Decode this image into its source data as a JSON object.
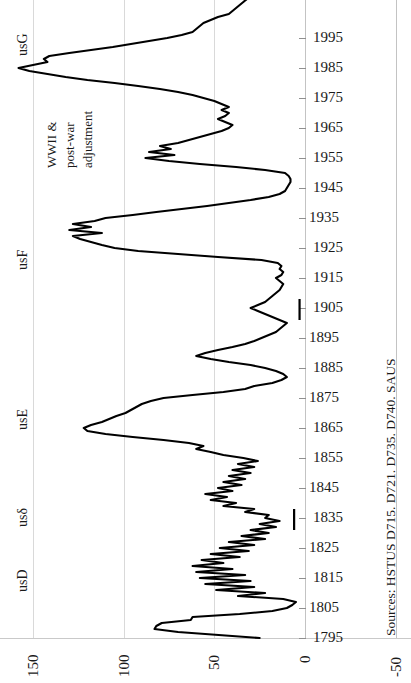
{
  "chart_data": {
    "type": "line",
    "title": "",
    "orientation": "rotated-90",
    "xlabel": "",
    "ylabel": "",
    "grid": true,
    "legend": null,
    "value_axis": {
      "name": "value",
      "position": "bottom",
      "ticks": [
        "150",
        "100",
        "50",
        "0",
        "-50"
      ],
      "tick_values": [
        150,
        100,
        50,
        0,
        -50
      ],
      "range": [
        -50,
        165
      ]
    },
    "year_axis": {
      "name": "year",
      "position": "right",
      "ticks": [
        "1995",
        "1985",
        "1975",
        "1965",
        "1955",
        "1945",
        "1935",
        "1925",
        "1915",
        "1905",
        "1895",
        "1885",
        "1875",
        "1865",
        "1855",
        "1845",
        "1835",
        "1825",
        "1815",
        "1805",
        "1795"
      ],
      "tick_values": [
        1995,
        1985,
        1975,
        1965,
        1955,
        1945,
        1935,
        1925,
        1915,
        1905,
        1895,
        1885,
        1875,
        1865,
        1855,
        1845,
        1835,
        1825,
        1815,
        1805,
        1795
      ],
      "range": [
        1795,
        2005
      ]
    },
    "series": [
      {
        "name": "us-series",
        "color": "#000000",
        "points": [
          [
            1795,
            25
          ],
          [
            1797,
            70
          ],
          [
            1798,
            83
          ],
          [
            1799,
            82
          ],
          [
            1800,
            79
          ],
          [
            1801,
            63
          ],
          [
            1802,
            62
          ],
          [
            1803,
            36
          ],
          [
            1804,
            18
          ],
          [
            1805,
            10
          ],
          [
            1806,
            7
          ],
          [
            1807,
            5
          ],
          [
            1808,
            12
          ],
          [
            1809,
            37
          ],
          [
            1810,
            22
          ],
          [
            1811,
            49
          ],
          [
            1812,
            28
          ],
          [
            1813,
            55
          ],
          [
            1814,
            30
          ],
          [
            1815,
            58
          ],
          [
            1816,
            33
          ],
          [
            1817,
            60
          ],
          [
            1818,
            40
          ],
          [
            1819,
            62
          ],
          [
            1820,
            45
          ],
          [
            1821,
            57
          ],
          [
            1822,
            36
          ],
          [
            1823,
            52
          ],
          [
            1824,
            31
          ],
          [
            1825,
            47
          ],
          [
            1826,
            28
          ],
          [
            1827,
            42
          ],
          [
            1828,
            22
          ],
          [
            1829,
            35
          ],
          [
            1830,
            20
          ],
          [
            1831,
            30
          ],
          [
            1832,
            16
          ],
          [
            1833,
            25
          ],
          [
            1834,
            14
          ],
          [
            1835,
            22
          ],
          [
            1836,
            20
          ],
          [
            1837,
            33
          ],
          [
            1838,
            28
          ],
          [
            1839,
            45
          ],
          [
            1840,
            38
          ],
          [
            1841,
            52
          ],
          [
            1842,
            43
          ],
          [
            1843,
            55
          ],
          [
            1844,
            40
          ],
          [
            1845,
            48
          ],
          [
            1846,
            35
          ],
          [
            1847,
            45
          ],
          [
            1848,
            33
          ],
          [
            1849,
            42
          ],
          [
            1850,
            30
          ],
          [
            1851,
            40
          ],
          [
            1852,
            28
          ],
          [
            1853,
            37
          ],
          [
            1854,
            26
          ],
          [
            1855,
            34
          ],
          [
            1856,
            45
          ],
          [
            1857,
            52
          ],
          [
            1858,
            60
          ],
          [
            1859,
            56
          ],
          [
            1860,
            64
          ],
          [
            1861,
            78
          ],
          [
            1862,
            95
          ],
          [
            1863,
            110
          ],
          [
            1864,
            120
          ],
          [
            1865,
            122
          ],
          [
            1866,
            118
          ],
          [
            1867,
            112
          ],
          [
            1868,
            108
          ],
          [
            1869,
            104
          ],
          [
            1870,
            99
          ],
          [
            1871,
            96
          ],
          [
            1872,
            93
          ],
          [
            1873,
            90
          ],
          [
            1874,
            85
          ],
          [
            1875,
            78
          ],
          [
            1876,
            62
          ],
          [
            1877,
            45
          ],
          [
            1878,
            33
          ],
          [
            1879,
            28
          ],
          [
            1880,
            18
          ],
          [
            1881,
            13
          ],
          [
            1882,
            10
          ],
          [
            1883,
            12
          ],
          [
            1884,
            16
          ],
          [
            1885,
            22
          ],
          [
            1886,
            30
          ],
          [
            1887,
            42
          ],
          [
            1888,
            52
          ],
          [
            1889,
            60
          ],
          [
            1890,
            55
          ],
          [
            1891,
            48
          ],
          [
            1892,
            40
          ],
          [
            1893,
            33
          ],
          [
            1894,
            28
          ],
          [
            1895,
            24
          ],
          [
            1896,
            20
          ],
          [
            1897,
            16
          ],
          [
            1898,
            14
          ],
          [
            1899,
            12
          ],
          [
            1900,
            10
          ],
          [
            1901,
            14
          ],
          [
            1902,
            18
          ],
          [
            1903,
            22
          ],
          [
            1904,
            26
          ],
          [
            1905,
            30
          ],
          [
            1906,
            26
          ],
          [
            1907,
            22
          ],
          [
            1908,
            20
          ],
          [
            1909,
            18
          ],
          [
            1910,
            16
          ],
          [
            1911,
            14
          ],
          [
            1912,
            13
          ],
          [
            1913,
            12
          ],
          [
            1914,
            14
          ],
          [
            1915,
            16
          ],
          [
            1916,
            13
          ],
          [
            1917,
            12
          ],
          [
            1918,
            14
          ],
          [
            1919,
            13
          ],
          [
            1920,
            15
          ],
          [
            1921,
            24
          ],
          [
            1922,
            48
          ],
          [
            1923,
            70
          ],
          [
            1924,
            92
          ],
          [
            1925,
            105
          ],
          [
            1926,
            112
          ],
          [
            1927,
            118
          ],
          [
            1928,
            124
          ],
          [
            1929,
            128
          ],
          [
            1930,
            112
          ],
          [
            1931,
            130
          ],
          [
            1932,
            118
          ],
          [
            1933,
            128
          ],
          [
            1934,
            116
          ],
          [
            1935,
            110
          ],
          [
            1936,
            95
          ],
          [
            1937,
            82
          ],
          [
            1938,
            68
          ],
          [
            1939,
            54
          ],
          [
            1940,
            42
          ],
          [
            1941,
            30
          ],
          [
            1942,
            20
          ],
          [
            1943,
            14
          ],
          [
            1944,
            11
          ],
          [
            1945,
            10
          ],
          [
            1946,
            9
          ],
          [
            1947,
            8
          ],
          [
            1948,
            8
          ],
          [
            1949,
            9
          ],
          [
            1950,
            11
          ],
          [
            1951,
            22
          ],
          [
            1952,
            38
          ],
          [
            1953,
            58
          ],
          [
            1954,
            75
          ],
          [
            1955,
            88
          ],
          [
            1956,
            72
          ],
          [
            1957,
            86
          ],
          [
            1958,
            74
          ],
          [
            1959,
            80
          ],
          [
            1960,
            70
          ],
          [
            1961,
            64
          ],
          [
            1962,
            58
          ],
          [
            1963,
            52
          ],
          [
            1964,
            46
          ],
          [
            1965,
            42
          ],
          [
            1966,
            40
          ],
          [
            1967,
            44
          ],
          [
            1968,
            48
          ],
          [
            1969,
            44
          ],
          [
            1970,
            42
          ],
          [
            1971,
            46
          ],
          [
            1972,
            42
          ],
          [
            1973,
            46
          ],
          [
            1974,
            50
          ],
          [
            1975,
            56
          ],
          [
            1976,
            62
          ],
          [
            1977,
            70
          ],
          [
            1978,
            80
          ],
          [
            1979,
            92
          ],
          [
            1980,
            105
          ],
          [
            1981,
            120
          ],
          [
            1982,
            132
          ],
          [
            1983,
            142
          ],
          [
            1984,
            152
          ],
          [
            1985,
            158
          ],
          [
            1986,
            150
          ],
          [
            1987,
            142
          ],
          [
            1988,
            144
          ],
          [
            1989,
            141
          ],
          [
            1990,
            130
          ],
          [
            1991,
            118
          ],
          [
            1992,
            106
          ],
          [
            1993,
            96
          ],
          [
            1994,
            86
          ],
          [
            1995,
            76
          ],
          [
            1996,
            68
          ],
          [
            1997,
            62
          ],
          [
            1998,
            60
          ],
          [
            1999,
            58
          ],
          [
            2000,
            56
          ],
          [
            2001,
            52
          ],
          [
            2002,
            48
          ],
          [
            2003,
            42
          ],
          [
            2004,
            40
          ],
          [
            2005,
            38
          ],
          [
            2006,
            36
          ],
          [
            2007,
            34
          ],
          [
            2008,
            32
          ],
          [
            2009,
            38
          ],
          [
            2010,
            30
          ],
          [
            2011,
            34
          ],
          [
            2012,
            26
          ],
          [
            2013,
            30
          ],
          [
            2014,
            28
          ]
        ]
      }
    ],
    "markers": [
      {
        "name": "tick-1905",
        "year_top": 1908,
        "year_bottom": 1901,
        "value": 3
      },
      {
        "name": "tick-1835",
        "year_top": 1838,
        "year_bottom": 1831,
        "value": 6
      }
    ],
    "annotations": [
      {
        "name": "wwii-annotation",
        "lines": [
          "WWII &",
          "post-war",
          "adjustment"
        ],
        "year": 1957,
        "value": 142
      }
    ],
    "era_labels": [
      {
        "name": "usG",
        "label": "usG",
        "year": 1992
      },
      {
        "name": "usF",
        "label": "usF",
        "year": 1922
      },
      {
        "name": "usE",
        "label": "usE",
        "year": 1869
      },
      {
        "name": "usdelta",
        "label": "usδ",
        "year": 1834
      },
      {
        "name": "usD",
        "label": "usD",
        "year": 1808
      }
    ],
    "source_note": "Sources: HSTUS D715. D721. D735. D740. SAUS"
  }
}
